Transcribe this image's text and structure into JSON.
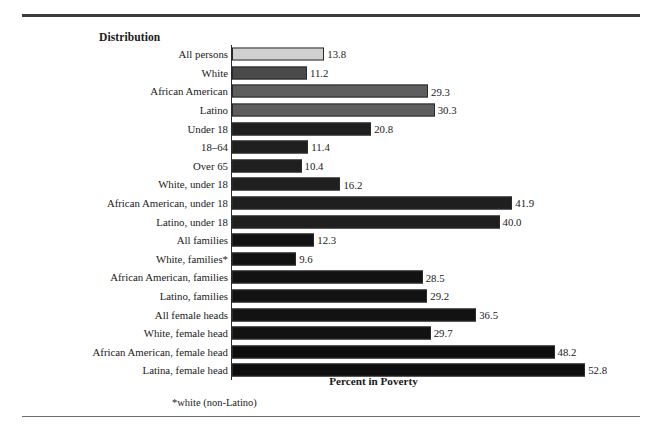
{
  "figure": {
    "column_header": "Distribution",
    "axis_title": "Percent in Poverty",
    "footnote": "*white (non-Latino)"
  },
  "chart_data": {
    "type": "bar",
    "orientation": "horizontal",
    "title": "",
    "xlabel": "Percent in Poverty",
    "ylabel": "Distribution",
    "xlim": [
      0,
      55
    ],
    "grid": false,
    "legend": false,
    "value_format": "one-decimal",
    "categories": [
      "All persons",
      "White",
      "African American",
      "Latino",
      "Under 18",
      "18–64",
      "Over 65",
      "White, under 18",
      "African American, under 18",
      "Latino, under 18",
      "All families",
      "White, families*",
      "African American, families",
      "Latino, families",
      "All female heads",
      "White, female head",
      "African American, female head",
      "Latina, female head"
    ],
    "values": [
      13.8,
      11.2,
      29.3,
      30.3,
      20.8,
      11.4,
      10.4,
      16.2,
      41.9,
      40.0,
      12.3,
      9.6,
      28.5,
      29.2,
      36.5,
      29.7,
      48.2,
      52.8
    ],
    "labels": [
      "13.8",
      "11.2",
      "29.3",
      "30.3",
      "20.8",
      "11.4",
      "10.4",
      "16.2",
      "41.9",
      "40.0",
      "12.3",
      "9.6",
      "28.5",
      "29.2",
      "36.5",
      "29.7",
      "48.2",
      "52.8"
    ],
    "bar_colors": [
      "#d0d0d0",
      "#4a4a4a",
      "#5e5e5e",
      "#5e5e5e",
      "#1f1f1f",
      "#1f1f1f",
      "#1f1f1f",
      "#1f1f1f",
      "#1f1f1f",
      "#1f1f1f",
      "#121212",
      "#121212",
      "#121212",
      "#121212",
      "#121212",
      "#121212",
      "#0d0d0d",
      "#0d0d0d"
    ],
    "bar_border_color": "#2a2a2a",
    "axis_color": "#2a2a2a",
    "background_color": "#ffffff"
  }
}
